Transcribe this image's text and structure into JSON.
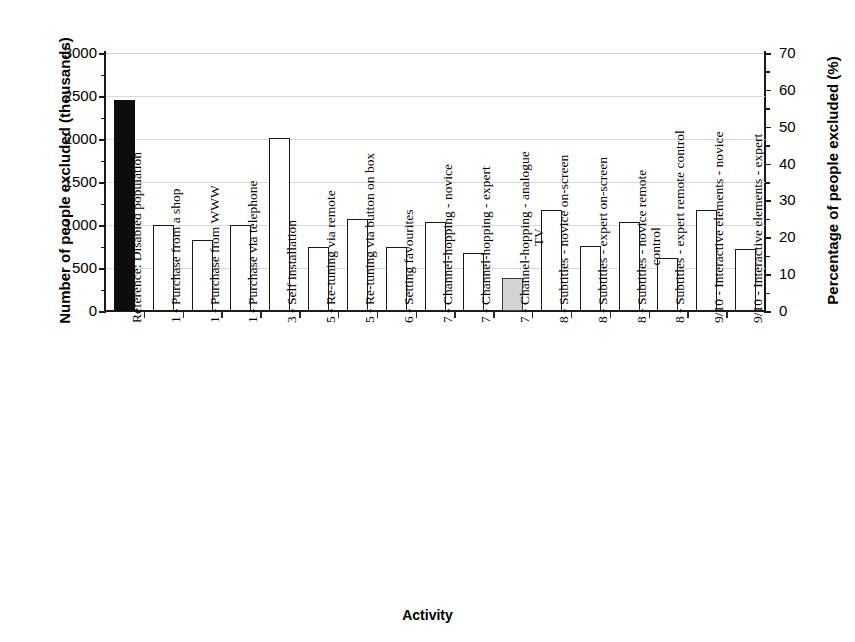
{
  "figure": {
    "bleed_fragment": "",
    "x_axis_title": "Activity",
    "y_axis_left_title": "Number of people excluded (thousands)",
    "y_axis_right_title": "Percentage of people excluded (%)"
  },
  "chart_data": {
    "type": "bar",
    "title": "",
    "xlabel": "Activity",
    "ylabel": "Number of people excluded (thousands)",
    "ylabel_secondary": "Percentage of people excluded (%)",
    "ylim": [
      0,
      3000
    ],
    "ylim_secondary": [
      0,
      70
    ],
    "yticks": [
      0,
      500,
      1000,
      1500,
      2000,
      2500,
      3000
    ],
    "yticks_secondary": [
      0,
      10,
      20,
      30,
      40,
      50,
      60,
      70
    ],
    "grid": true,
    "legend": "none",
    "total_population_thousands": 4286,
    "colors": {
      "reference_bar": "#0d0d0d",
      "standard_bar": "#ffffff",
      "highlight_bar": "#d3d3d3",
      "outline": "#1a1a1a",
      "gridline": "#d8d8d8"
    },
    "categories": [
      "Reference: Disabled population",
      "1 - Purchase from a shop",
      "1 - Purchase from WWW",
      "1 - Purchase via telephone",
      "3 - Self installation",
      "5 - Re-tuning via remote",
      "5 - Re-tuning via button on box",
      "6 - Setting favourites",
      "7 - Channel-hopping - novice",
      "7 - Channel-hopping - expert",
      "7 - Channel-hopping - analogue TV",
      "8 - Subtitles - novice on-screen",
      "8 - Subtitles - expert on-screen",
      "8 - Subtitles - novice remote control",
      "8 - Subtitles - expert remote control",
      "9/10 - Interactive elements - novice",
      "9/10 - Interactive elements - expert"
    ],
    "values": [
      2450,
      1000,
      820,
      1000,
      2010,
      750,
      1070,
      750,
      1040,
      670,
      380,
      1180,
      760,
      1040,
      620,
      1180,
      720
    ],
    "values_percent": [
      57.2,
      23.3,
      19.1,
      23.3,
      46.9,
      17.5,
      25.0,
      17.5,
      24.3,
      15.6,
      8.9,
      27.5,
      17.7,
      24.3,
      14.5,
      27.5,
      16.8
    ],
    "bar_styles": [
      "black",
      "white",
      "white",
      "white",
      "white",
      "white",
      "white",
      "white",
      "white",
      "white",
      "grey",
      "white",
      "white",
      "white",
      "white",
      "white",
      "white"
    ],
    "bars": [
      {
        "label": "Reference: Disabled population",
        "label_lines": [
          "Reference: Disabled population"
        ],
        "value": 2450,
        "percent": 57.2,
        "style": "black"
      },
      {
        "label": "1 - Purchase from a shop",
        "label_lines": [
          "1 - Purchase from a shop"
        ],
        "value": 1000,
        "percent": 23.3,
        "style": "white"
      },
      {
        "label": "1 - Purchase from WWW",
        "label_lines": [
          "1 - Purchase from WWW"
        ],
        "value": 820,
        "percent": 19.1,
        "style": "white"
      },
      {
        "label": "1 - Purchase via telephone",
        "label_lines": [
          "1 - Purchase via telephone"
        ],
        "value": 1000,
        "percent": 23.3,
        "style": "white"
      },
      {
        "label": "3 - Self installation",
        "label_lines": [
          "3 - Self installation"
        ],
        "value": 2010,
        "percent": 46.9,
        "style": "white"
      },
      {
        "label": "5 - Re-tuning via remote",
        "label_lines": [
          "5 - Re-tuning via remote"
        ],
        "value": 750,
        "percent": 17.5,
        "style": "white"
      },
      {
        "label": "5 - Re-tuning via button on box",
        "label_lines": [
          "5 - Re-tuning via button on box"
        ],
        "value": 1070,
        "percent": 25.0,
        "style": "white"
      },
      {
        "label": "6 - Setting favourites",
        "label_lines": [
          "6 - Setting favourites"
        ],
        "value": 750,
        "percent": 17.5,
        "style": "white"
      },
      {
        "label": "7 - Channel-hopping - novice",
        "label_lines": [
          "7 - Channel-hopping - novice"
        ],
        "value": 1040,
        "percent": 24.3,
        "style": "white"
      },
      {
        "label": "7 - Channel-hopping - expert",
        "label_lines": [
          "7 - Channel-hopping - expert"
        ],
        "value": 670,
        "percent": 15.6,
        "style": "white"
      },
      {
        "label": "7 - Channel-hopping - analogue TV",
        "label_lines": [
          "7 - Channel-hopping - analogue",
          "TV"
        ],
        "value": 380,
        "percent": 8.9,
        "style": "grey"
      },
      {
        "label": "8 - Subtitles - novice on-screen",
        "label_lines": [
          "8 - Subtitles - novice on-screen"
        ],
        "value": 1180,
        "percent": 27.5,
        "style": "white"
      },
      {
        "label": "8 - Subtitles - expert on-screen",
        "label_lines": [
          "8 - Subtitles - expert on-screen"
        ],
        "value": 760,
        "percent": 17.7,
        "style": "white"
      },
      {
        "label": "8 - Subtitles - novice remote control",
        "label_lines": [
          "8 - Subtitles - novice remote",
          "control"
        ],
        "value": 1040,
        "percent": 24.3,
        "style": "white"
      },
      {
        "label": "8 - Subtitles - expert remote control",
        "label_lines": [
          "8 - Subtitles - expert remote control"
        ],
        "value": 620,
        "percent": 14.5,
        "style": "white"
      },
      {
        "label": "9/10 - Interactive elements - novice",
        "label_lines": [
          "9/10 - Interactive elements - novice"
        ],
        "value": 1180,
        "percent": 27.5,
        "style": "white"
      },
      {
        "label": "9/10 - Interactive elements - expert",
        "label_lines": [
          "9/10 - Interactive elements - expert"
        ],
        "value": 720,
        "percent": 16.8,
        "style": "white"
      }
    ]
  }
}
